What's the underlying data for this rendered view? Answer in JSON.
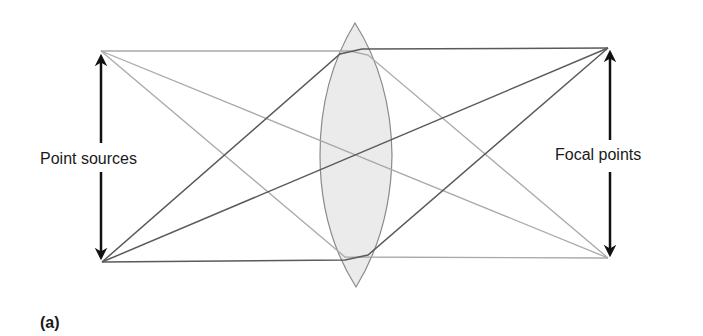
{
  "figure": {
    "panel_label": "(a)",
    "left_label": "Point sources",
    "right_label": "Focal points"
  },
  "colors": {
    "background": "#ffffff",
    "lens_fill": "#ebebeb",
    "lens_stroke": "#8a8a8a",
    "light_ray": "#a9a9a9",
    "dark_ray": "#5a5a5a",
    "arrow": "#111111",
    "text": "#1a1a1a"
  },
  "geometry": {
    "source_top": [
      101,
      51
    ],
    "source_bottom": [
      102,
      262
    ],
    "focal_top": [
      608,
      48
    ],
    "focal_bottom": [
      608,
      258
    ],
    "lens_center": [
      355,
      155
    ],
    "lens_top": [
      355,
      23
    ],
    "lens_bottom": [
      356,
      287
    ],
    "lens_half_width": 36
  }
}
